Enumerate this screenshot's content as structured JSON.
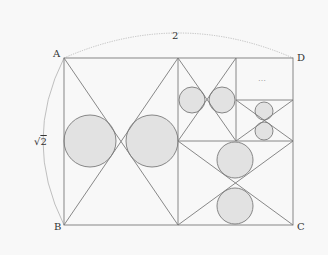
{
  "diagram": {
    "labels": {
      "A": "A",
      "B": "B",
      "C": "C",
      "D": "D",
      "top_dimension": "2",
      "left_dimension_symbol": "√",
      "left_dimension_value": "2",
      "ellipsis": "…"
    },
    "colors": {
      "line": "#7a7a7a",
      "circle_fill": "#e2e2e2",
      "circle_stroke": "#7a7a7a",
      "arc": "#aaaaaa",
      "background": "#f8f8f8"
    },
    "outer_rect": {
      "x1": 64,
      "y1": 58,
      "x2": 293,
      "y2": 225
    },
    "regions": [
      {
        "name": "left",
        "x1": 64,
        "y1": 58,
        "x2": 178,
        "y2": 225
      },
      {
        "name": "top-middle",
        "x1": 178,
        "y1": 58,
        "x2": 236,
        "y2": 141
      },
      {
        "name": "right-small",
        "x1": 236,
        "y1": 100,
        "x2": 293,
        "y2": 141
      },
      {
        "name": "bottom",
        "x1": 178,
        "y1": 141,
        "x2": 293,
        "y2": 225
      }
    ],
    "circles": [
      {
        "cx": 90,
        "cy": 141,
        "r": 26
      },
      {
        "cx": 152,
        "cy": 141,
        "r": 26
      },
      {
        "cx": 192,
        "cy": 100,
        "r": 13
      },
      {
        "cx": 222,
        "cy": 100,
        "r": 13
      },
      {
        "cx": 264,
        "cy": 111,
        "r": 9
      },
      {
        "cx": 264,
        "cy": 131,
        "r": 9
      },
      {
        "cx": 235,
        "cy": 160,
        "r": 18
      },
      {
        "cx": 235,
        "cy": 206,
        "r": 18
      }
    ]
  }
}
